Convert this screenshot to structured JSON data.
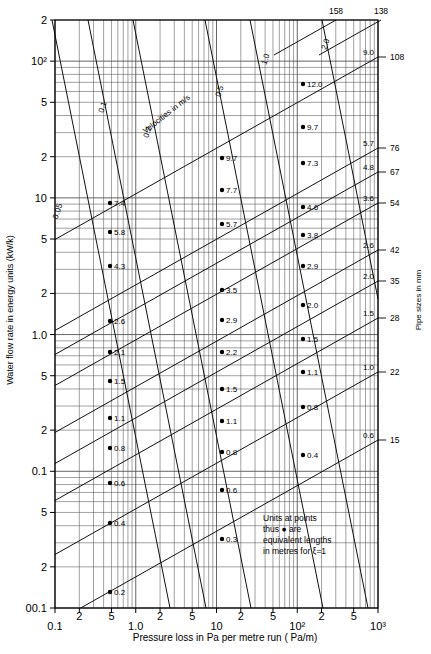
{
  "chart_data": {
    "type": "line",
    "title": "",
    "xlabel": "Pressure loss in Pa per metre run ( Pa/m)",
    "ylabel": "Water flow rate in energy units (kW/k)",
    "y2label": "Pipe sizes in mm",
    "xlim": [
      0.1,
      1000
    ],
    "ylim": [
      0.01,
      200
    ],
    "xscale": "log",
    "yscale": "log",
    "grid": true,
    "legend": "none",
    "xticks": [
      {
        "value": 0.1,
        "label": "0.1"
      },
      {
        "value": 0.2,
        "label": "2"
      },
      {
        "value": 0.5,
        "label": "5"
      },
      {
        "value": 1.0,
        "label": "1.0"
      },
      {
        "value": 2,
        "label": "2"
      },
      {
        "value": 5,
        "label": "5"
      },
      {
        "value": 10,
        "label": "10"
      },
      {
        "value": 20,
        "label": "2"
      },
      {
        "value": 50,
        "label": "5"
      },
      {
        "value": 100,
        "label": "10²"
      },
      {
        "value": 200,
        "label": "2"
      },
      {
        "value": 500,
        "label": "5"
      },
      {
        "value": 1000,
        "label": "10³"
      }
    ],
    "yticks": [
      {
        "value": 200,
        "label": "2"
      },
      {
        "value": 100,
        "label": "10²"
      },
      {
        "value": 50,
        "label": "5"
      },
      {
        "value": 20,
        "label": "2"
      },
      {
        "value": 10,
        "label": "10"
      },
      {
        "value": 5,
        "label": "5"
      },
      {
        "value": 2,
        "label": "2"
      },
      {
        "value": 1.0,
        "label": "1.0"
      },
      {
        "value": 0.5,
        "label": "5"
      },
      {
        "value": 0.2,
        "label": "2"
      },
      {
        "value": 0.1,
        "label": "0.1"
      },
      {
        "value": 0.05,
        "label": "5"
      },
      {
        "value": 0.02,
        "label": "2"
      },
      {
        "value": 0.01,
        "label": "00.1"
      }
    ],
    "pipe_sizes": [
      {
        "size": "158",
        "velocity": "",
        "position": "top"
      },
      {
        "size": "138",
        "velocity": "",
        "position": "top"
      },
      {
        "size": "108",
        "velocity": "9.0",
        "position": "right"
      },
      {
        "size": "76",
        "velocity": "5.7",
        "position": "right"
      },
      {
        "size": "67",
        "velocity": "4.8",
        "position": "right"
      },
      {
        "size": "54",
        "velocity": "3.6",
        "position": "right"
      },
      {
        "size": "42",
        "velocity": "2.6",
        "position": "right"
      },
      {
        "size": "35",
        "velocity": "2.0",
        "position": "right"
      },
      {
        "size": "28",
        "velocity": "1.5",
        "position": "right"
      },
      {
        "size": "22",
        "velocity": "1.0",
        "position": "right"
      },
      {
        "size": "15",
        "velocity": "0.6",
        "position": "right"
      }
    ],
    "velocity_lines": [
      {
        "label": "0.05"
      },
      {
        "label": "0.1"
      },
      {
        "label": "0.2"
      },
      {
        "label": "0.5"
      },
      {
        "label": "1.0"
      },
      {
        "label": "2.0"
      }
    ],
    "velocity_caption": "Velocities in m/s",
    "equivalent_length_points": {
      "column_left": [
        "7.4",
        "5.8",
        "4.3",
        "2.6",
        "2.1",
        "1.5",
        "1.1",
        "0.8",
        "0.6",
        "0.4",
        "0.2"
      ],
      "column_mid": [
        "9.7",
        "7.7",
        "5.7",
        "3.5",
        "2.9",
        "2.2",
        "1.5",
        "1.1",
        "0.8",
        "0.6",
        "0.3"
      ],
      "column_right": [
        "12.0",
        "9.7",
        "7.3",
        "4.6",
        "3.8",
        "2.9",
        "2.0",
        "1.5",
        "1.1",
        "0.8",
        "0.4"
      ]
    },
    "note": {
      "line1": "Units at points",
      "line2": "thus ● are",
      "line3": "equivalent lengths",
      "line4": "in metres for ξ=1"
    }
  }
}
